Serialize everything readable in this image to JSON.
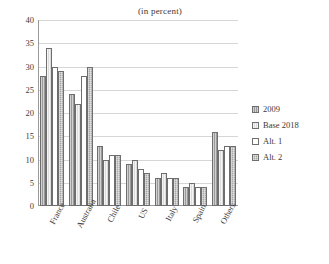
{
  "chart_data": {
    "type": "bar",
    "title": "(in percent)",
    "xlabel": "",
    "ylabel": "",
    "ylim": [
      0,
      40
    ],
    "yticks": [
      40,
      35,
      30,
      25,
      20,
      15,
      10,
      5,
      0
    ],
    "grid": true,
    "legend_position": "right",
    "categories": [
      "France",
      "Australia",
      "Chile",
      "US",
      "Italy",
      "Spain",
      "Others"
    ],
    "series": [
      {
        "name": "2009",
        "values": [
          28,
          24,
          13,
          9,
          6,
          4,
          16
        ]
      },
      {
        "name": "Base 2018",
        "values": [
          34,
          22,
          10,
          10,
          7,
          5,
          12
        ]
      },
      {
        "name": "Alt. 1",
        "values": [
          30,
          28,
          11,
          8,
          6,
          4,
          13
        ]
      },
      {
        "name": "Alt. 2",
        "values": [
          29,
          30,
          11,
          7,
          6,
          4,
          13
        ]
      }
    ],
    "series_colors": [
      "#9a9a9a",
      "#dcdcdc",
      "#ffffff",
      "#a8a8a8"
    ]
  }
}
